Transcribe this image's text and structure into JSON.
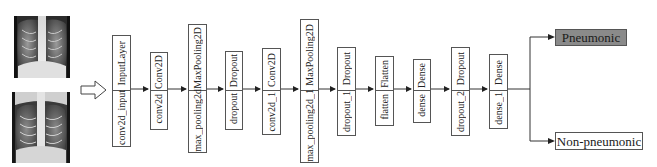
{
  "diagram": {
    "type": "cnn-architecture-flow",
    "inputs": [
      {
        "name": "chest-xray-1",
        "description": "chest X-ray image"
      },
      {
        "name": "chest-xray-2",
        "description": "chest X-ray image"
      }
    ],
    "layers": [
      {
        "type": "InputLayer",
        "name": "conv2d_input"
      },
      {
        "type": "Conv2D",
        "name": "conv2d"
      },
      {
        "type": "MaxPooling2D",
        "name": "max_pooling2d"
      },
      {
        "type": "Dropout",
        "name": "dropout"
      },
      {
        "type": "Conv2D",
        "name": "conv2d_1"
      },
      {
        "type": "MaxPooling2D",
        "name": "max_pooling2d_1"
      },
      {
        "type": "Dropout",
        "name": "dropout_1"
      },
      {
        "type": "Flatten",
        "name": "flatten"
      },
      {
        "type": "Dense",
        "name": "dense"
      },
      {
        "type": "Dropout",
        "name": "dropout_2"
      },
      {
        "type": "Dense",
        "name": "dense_1"
      }
    ],
    "outputs": [
      {
        "label": "Pneumonic",
        "fill": "#8a8a8a"
      },
      {
        "label": "Non-pneumonic",
        "fill": "#ffffff"
      }
    ],
    "colors": {
      "line": "#333333",
      "box_border": "#555555"
    }
  }
}
